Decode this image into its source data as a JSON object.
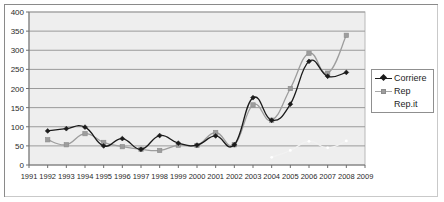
{
  "chart_data": {
    "type": "line",
    "title": "",
    "xlabel": "",
    "ylabel": "",
    "x": [
      1991,
      1992,
      1993,
      1994,
      1995,
      1996,
      1997,
      1998,
      1999,
      2000,
      2001,
      2002,
      2003,
      2004,
      2005,
      2006,
      2007,
      2008,
      2009
    ],
    "xtick_labels": [
      "1991",
      "1992",
      "1993",
      "1994",
      "1995",
      "1996",
      "1997",
      "1998",
      "1999",
      "2000",
      "2001",
      "2002",
      "2003",
      "2004",
      "2005",
      "2006",
      "2007",
      "2008",
      "2009"
    ],
    "ytick_labels": [
      "0",
      "50",
      "100",
      "150",
      "200",
      "250",
      "300",
      "350",
      "400"
    ],
    "yticks": [
      0,
      50,
      100,
      150,
      200,
      250,
      300,
      350,
      400
    ],
    "ylim": [
      0,
      400
    ],
    "xlim": [
      1991,
      2009
    ],
    "grid": "horizontal",
    "legend_position": "right-outside",
    "series": [
      {
        "name": "Corriere",
        "color": "#1b1b1b",
        "marker": "diamond",
        "x": [
          1992,
          1993,
          1994,
          1995,
          1996,
          1997,
          1998,
          1999,
          2000,
          2001,
          2002,
          2003,
          2004,
          2005,
          2006,
          2007,
          2008
        ],
        "values": [
          89,
          95,
          99,
          50,
          69,
          41,
          77,
          57,
          52,
          76,
          53,
          176,
          117,
          159,
          271,
          232,
          242
        ]
      },
      {
        "name": "Rep",
        "color": "#9d9d9d",
        "marker": "square",
        "x": [
          1992,
          1993,
          1994,
          1995,
          1996,
          1997,
          1998,
          1999,
          2000,
          2001,
          2002,
          2003,
          2004,
          2005,
          2006,
          2007,
          2008
        ],
        "values": [
          66,
          53,
          82,
          59,
          48,
          41,
          38,
          52,
          51,
          85,
          53,
          157,
          117,
          200,
          292,
          240,
          339
        ]
      },
      {
        "name": "Rep.it",
        "color": "#f2f2f2",
        "marker": "none",
        "x": [
          2004,
          2005,
          2006,
          2007,
          2008
        ],
        "values": [
          20,
          38,
          62,
          45,
          63
        ]
      }
    ]
  },
  "legend": {
    "items": [
      {
        "label": "Corriere",
        "marker": "diamond-black-line"
      },
      {
        "label": "Rep",
        "marker": "square-gray-line"
      },
      {
        "label": "Rep.it",
        "marker": "none"
      }
    ]
  }
}
